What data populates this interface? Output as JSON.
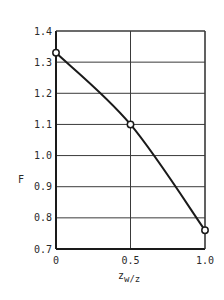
{
  "chart_data": {
    "type": "line",
    "title": "",
    "xlabel": "z_w/z",
    "ylabel": "F",
    "xlim": [
      0,
      1.0
    ],
    "ylim": [
      0.7,
      1.4
    ],
    "x_ticks": [
      "0",
      "0.5",
      "1.0"
    ],
    "y_ticks": [
      "0.7",
      "0.8",
      "0.9",
      "1.0",
      "1.1",
      "1.2",
      "1.3",
      "1.4"
    ],
    "grid": true,
    "legend": null,
    "series": [
      {
        "name": "F",
        "x": [
          0,
          0.5,
          1.0
        ],
        "values": [
          1.33,
          1.1,
          0.76
        ],
        "markers": "open-circle"
      }
    ]
  },
  "labels": {
    "y_axis": "F",
    "x_axis_main": "z",
    "x_axis_sub": "w/z"
  },
  "colors": {
    "line": "#1a1a1a",
    "grid": "#3a3a3a",
    "background": "#ffffff"
  }
}
